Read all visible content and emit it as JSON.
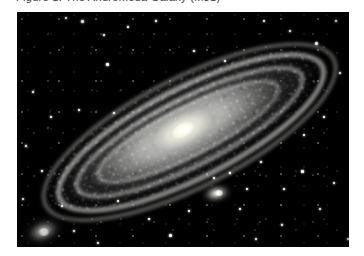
{
  "page": {
    "background_color": "#ffffff",
    "width": 364,
    "height": 256
  },
  "header": {
    "clipped_text": "Figure 1. The Andromeda Galaxy (M31)",
    "note": "text row is clipped by the top edge of the screenshot; only glyph bottoms are visible"
  },
  "photo": {
    "name": "andromeda-galaxy-photo",
    "alt": "Andromeda Galaxy M31 grayscale astrophotograph",
    "background_color": "#000000",
    "x": 17,
    "y": 12,
    "width": 332,
    "height": 235,
    "rendering": "grayscale"
  },
  "galaxy": {
    "label": "M31",
    "core_color": "#fffef6",
    "halo_color": "#d6d6d2",
    "dust_color": "#08080a",
    "inclination_deg": -27,
    "core_x": 190,
    "core_y": 128
  },
  "satellites": [
    {
      "label": "M32",
      "x": 217,
      "y": 192,
      "core_color": "#fffffc"
    },
    {
      "label": "M110",
      "x": 36,
      "y": 235,
      "core_color": "#fffffc"
    }
  ],
  "starfield": {
    "color": "#ffffff",
    "count_label": "dense field"
  }
}
